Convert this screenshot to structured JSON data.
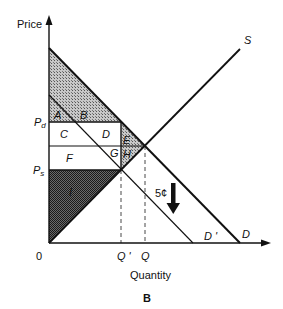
{
  "figure": {
    "panel_label": "B",
    "axes": {
      "y_label": "Price",
      "x_label": "Quantity",
      "origin_label": "0"
    },
    "price_ticks": {
      "pd": "P",
      "pd_sub": "d",
      "ps": "P",
      "ps_sub": "s"
    },
    "quantity_ticks": {
      "q_prime": "Q '",
      "q": "Q"
    },
    "curves": {
      "supply": "S",
      "demand": "D",
      "demand_shifted": "D '"
    },
    "regions": {
      "A": "A",
      "B": "B",
      "C": "C",
      "D": "D",
      "E": "E",
      "F": "F",
      "G": "G",
      "H": "H",
      "I": "I"
    },
    "tax": {
      "label": "5¢",
      "direction": "down"
    },
    "colors": {
      "line": "#111111",
      "shade_light": "#9a9a9a",
      "shade_dark": "#3a3a3a",
      "background": "#ffffff"
    }
  }
}
